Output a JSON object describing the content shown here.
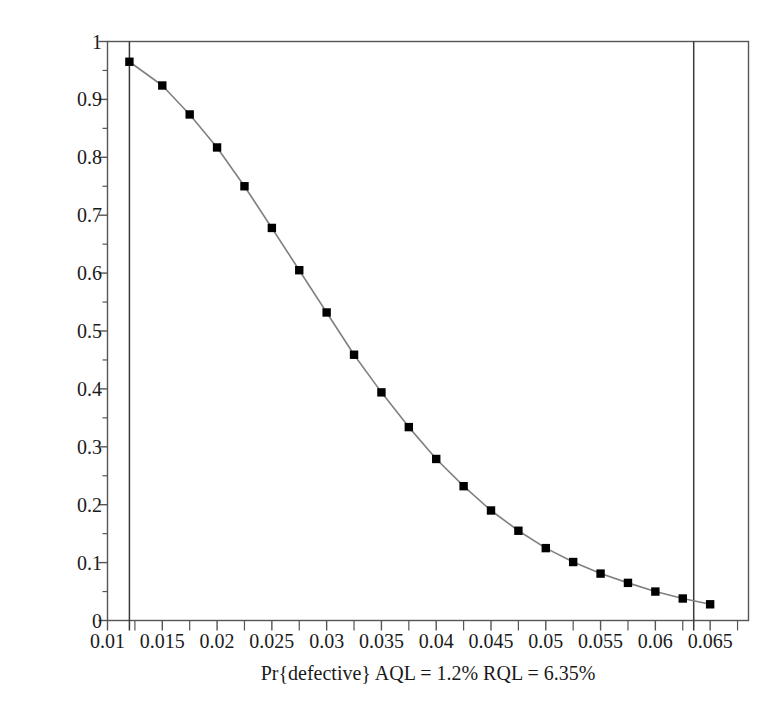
{
  "chart_data": {
    "type": "line",
    "title": "",
    "subtitle": "",
    "xlabel": "Pr{defective} AQL = 1.2% RQL = 6.35%",
    "ylabel": "Pr{Reject Ho|Pa}",
    "xlim": [
      0.01,
      0.0685
    ],
    "ylim": [
      0,
      1
    ],
    "grid": false,
    "legend": null,
    "x_tick_labels": [
      "0.01",
      "0.015",
      "0.02",
      "0.025",
      "0.03",
      "0.035",
      "0.04",
      "0.045",
      "0.05",
      "0.055",
      "0.06",
      "0.065"
    ],
    "x_tick_values": [
      0.01,
      0.015,
      0.02,
      0.025,
      0.03,
      0.035,
      0.04,
      0.045,
      0.05,
      0.055,
      0.06,
      0.065
    ],
    "x_minor_tick_values": [
      0.0125,
      0.0175,
      0.0225,
      0.0275,
      0.0325,
      0.0375,
      0.0425,
      0.0475,
      0.0525,
      0.0575,
      0.0625,
      0.0675
    ],
    "y_tick_labels": [
      "0",
      "0.1",
      "0.2",
      "0.3",
      "0.4",
      "0.5",
      "0.6",
      "0.7",
      "0.8",
      "0.9",
      "1"
    ],
    "y_tick_values": [
      0,
      0.1,
      0.2,
      0.3,
      0.4,
      0.5,
      0.6,
      0.7,
      0.8,
      0.9,
      1
    ],
    "marker": "filled-square",
    "marker_color": "#000000",
    "line_color": "#808080",
    "series": [
      {
        "name": "OC curve",
        "x": [
          0.012,
          0.015,
          0.0175,
          0.02,
          0.0225,
          0.025,
          0.0275,
          0.03,
          0.0325,
          0.035,
          0.0375,
          0.04,
          0.0425,
          0.045,
          0.0475,
          0.05,
          0.0525,
          0.055,
          0.0575,
          0.06,
          0.0625,
          0.065
        ],
        "values": [
          0.965,
          0.924,
          0.874,
          0.817,
          0.75,
          0.678,
          0.605,
          0.532,
          0.459,
          0.394,
          0.334,
          0.279,
          0.232,
          0.19,
          0.155,
          0.125,
          0.101,
          0.081,
          0.065,
          0.05,
          0.038,
          0.028
        ]
      }
    ],
    "reference_lines": [
      {
        "name": "AQL",
        "orientation": "vertical",
        "value": 0.012,
        "label": "AQL = 1.2%",
        "color": "#3a3a3a"
      },
      {
        "name": "RQL",
        "orientation": "vertical",
        "value": 0.0635,
        "label": "RQL = 6.35%",
        "color": "#3a3a3a"
      }
    ],
    "annotations": {
      "aql_percent": "1.2%",
      "rql_percent": "6.35%"
    }
  }
}
